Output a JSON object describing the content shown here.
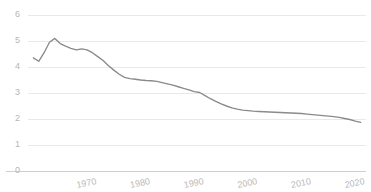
{
  "chart_data": {
    "type": "line",
    "title": "",
    "subtitle": "",
    "xlabel": "",
    "ylabel": "",
    "xlim": [
      1959,
      2022
    ],
    "ylim": [
      0,
      6
    ],
    "grid": true,
    "legend": false,
    "legend_position": "none",
    "line_color": "#8a8a8a",
    "gridline_color": "#e9e9e9",
    "axis_color": "#cfcfcf",
    "tick_label_color": "#b9b9b9",
    "yticks": [
      0,
      1,
      2,
      3,
      4,
      5,
      6
    ],
    "ytick_labels": [
      "0",
      "1",
      "2",
      "3",
      "4",
      "5",
      "6"
    ],
    "xticks": [
      1970,
      1980,
      1990,
      2000,
      2010,
      2020
    ],
    "xtick_labels": [
      "1970",
      "1980",
      "1990",
      "2000",
      "2010",
      "2020"
    ],
    "xtick_rotation": -12,
    "series": [
      {
        "name": "series-1",
        "x": [
          1960,
          1961,
          1962,
          1963,
          1964,
          1965,
          1966,
          1967,
          1968,
          1969,
          1970,
          1971,
          1972,
          1973,
          1974,
          1975,
          1976,
          1977,
          1978,
          1979,
          1980,
          1981,
          1982,
          1983,
          1984,
          1985,
          1986,
          1987,
          1988,
          1989,
          1990,
          1991,
          1992,
          1993,
          1994,
          1995,
          1996,
          1997,
          1998,
          1999,
          2000,
          2001,
          2002,
          2003,
          2004,
          2005,
          2006,
          2007,
          2008,
          2009,
          2010,
          2011,
          2012,
          2013,
          2014,
          2015,
          2016,
          2017,
          2018,
          2019,
          2020,
          2021
        ],
        "values": [
          4.35,
          4.22,
          4.55,
          4.95,
          5.1,
          4.9,
          4.8,
          4.72,
          4.66,
          4.7,
          4.66,
          4.55,
          4.4,
          4.25,
          4.05,
          3.88,
          3.72,
          3.6,
          3.55,
          3.53,
          3.5,
          3.48,
          3.47,
          3.45,
          3.4,
          3.35,
          3.3,
          3.24,
          3.18,
          3.12,
          3.05,
          3.02,
          2.9,
          2.78,
          2.68,
          2.58,
          2.5,
          2.43,
          2.38,
          2.34,
          2.32,
          2.3,
          2.29,
          2.28,
          2.27,
          2.26,
          2.25,
          2.24,
          2.23,
          2.22,
          2.21,
          2.19,
          2.17,
          2.15,
          2.13,
          2.11,
          2.09,
          2.06,
          2.02,
          1.98,
          1.92,
          1.87
        ]
      }
    ]
  }
}
